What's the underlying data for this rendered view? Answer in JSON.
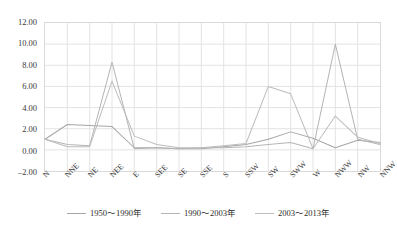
{
  "chart_data": {
    "type": "line",
    "title": "",
    "xlabel": "",
    "ylabel": "",
    "ylim": [
      -2.0,
      12.0
    ],
    "ytick_step": 2.0,
    "grid": true,
    "legend_position": "bottom",
    "categories": [
      "N",
      "NNE",
      "NE",
      "NEE",
      "E",
      "SEE",
      "SE",
      "SSE",
      "S",
      "SSW",
      "SW",
      "SWW",
      "W",
      "NWW",
      "NW",
      "NNW"
    ],
    "ytick_labels": [
      "12.00",
      "10.00",
      "8.00",
      "6.00",
      "4.00",
      "2.00",
      "0.00",
      "-2.00"
    ],
    "ytick_values": [
      12.0,
      10.0,
      8.0,
      6.0,
      4.0,
      2.0,
      0.0,
      -2.0
    ],
    "series": [
      {
        "name": "1950～1990年",
        "color": "#a6a6a6",
        "values": [
          1.0,
          2.4,
          2.3,
          2.2,
          0.2,
          0.2,
          0.1,
          0.1,
          0.3,
          0.5,
          1.0,
          1.7,
          1.1,
          0.2,
          0.9,
          0.7
        ]
      },
      {
        "name": "1990～2003年",
        "color": "#b5b5b5",
        "values": [
          1.0,
          0.5,
          0.4,
          8.3,
          0.1,
          0.2,
          0.1,
          0.2,
          0.2,
          0.3,
          0.5,
          0.7,
          0.1,
          10.0,
          1.0,
          0.5
        ]
      },
      {
        "name": "2003～2013年",
        "color": "#bdbdbd",
        "values": [
          1.0,
          0.3,
          0.3,
          6.5,
          1.3,
          0.5,
          0.2,
          0.2,
          0.4,
          0.6,
          6.0,
          5.3,
          0.1,
          3.2,
          1.2,
          0.6
        ]
      }
    ]
  },
  "legend": {
    "items": [
      {
        "label": "1950～1990年"
      },
      {
        "label": "1990～2003年"
      },
      {
        "label": "2003～2013年"
      }
    ]
  }
}
